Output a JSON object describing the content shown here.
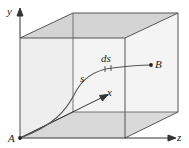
{
  "figure": {
    "colors": {
      "edge": "#555555",
      "face_shaded": "#d6d6d6",
      "face_light": "#f1f1f1",
      "curve": "#555555",
      "axis": "#333333"
    },
    "labels": {
      "y_axis": "y",
      "z_axis": "z",
      "x_axis": "x",
      "point_a": "A",
      "point_b": "B",
      "path": "s",
      "element": "ds"
    }
  }
}
